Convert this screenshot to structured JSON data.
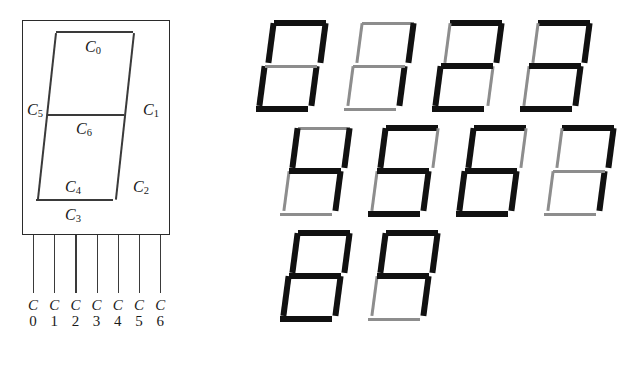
{
  "figure": {
    "segment_order": [
      "C0",
      "C1",
      "C2",
      "C3",
      "C4",
      "C5",
      "C6"
    ]
  },
  "diagram": {
    "name": "seven-segment-display",
    "segment_labels": [
      {
        "id": "C0",
        "letter": "C",
        "index": "0",
        "position": "top"
      },
      {
        "id": "C1",
        "letter": "C",
        "index": "1",
        "position": "top-right"
      },
      {
        "id": "C2",
        "letter": "C",
        "index": "2",
        "position": "bottom-right"
      },
      {
        "id": "C3",
        "letter": "C",
        "index": "3",
        "position": "bottom"
      },
      {
        "id": "C4",
        "letter": "C",
        "index": "4",
        "position": "bottom-left"
      },
      {
        "id": "C5",
        "letter": "C",
        "index": "5",
        "position": "top-left"
      },
      {
        "id": "C6",
        "letter": "C",
        "index": "6",
        "position": "middle"
      }
    ],
    "pins": [
      {
        "letter": "C",
        "index": "0"
      },
      {
        "letter": "C",
        "index": "1"
      },
      {
        "letter": "C",
        "index": "2"
      },
      {
        "letter": "C",
        "index": "3"
      },
      {
        "letter": "C",
        "index": "4"
      },
      {
        "letter": "C",
        "index": "5"
      },
      {
        "letter": "C",
        "index": "6"
      }
    ]
  },
  "colors": {
    "segment_on": "#111111",
    "segment_off": "#8d8d8d",
    "outline": "#2b2b2b",
    "background": "#ffffff"
  },
  "digits": [
    {
      "value": "0",
      "segments": {
        "C0": true,
        "C1": true,
        "C2": true,
        "C3": true,
        "C4": true,
        "C5": true,
        "C6": false
      }
    },
    {
      "value": "1",
      "segments": {
        "C0": false,
        "C1": true,
        "C2": true,
        "C3": false,
        "C4": false,
        "C5": false,
        "C6": false
      }
    },
    {
      "value": "2",
      "segments": {
        "C0": true,
        "C1": true,
        "C2": false,
        "C3": true,
        "C4": true,
        "C5": false,
        "C6": true
      }
    },
    {
      "value": "3",
      "segments": {
        "C0": true,
        "C1": true,
        "C2": true,
        "C3": true,
        "C4": false,
        "C5": false,
        "C6": true
      }
    },
    {
      "value": "4",
      "segments": {
        "C0": false,
        "C1": true,
        "C2": true,
        "C3": false,
        "C4": false,
        "C5": true,
        "C6": true
      }
    },
    {
      "value": "5",
      "segments": {
        "C0": true,
        "C1": false,
        "C2": true,
        "C3": true,
        "C4": false,
        "C5": true,
        "C6": true
      }
    },
    {
      "value": "6",
      "segments": {
        "C0": true,
        "C1": false,
        "C2": true,
        "C3": true,
        "C4": true,
        "C5": true,
        "C6": true
      }
    },
    {
      "value": "7",
      "segments": {
        "C0": true,
        "C1": true,
        "C2": true,
        "C3": false,
        "C4": false,
        "C5": false,
        "C6": false
      }
    },
    {
      "value": "8",
      "segments": {
        "C0": true,
        "C1": true,
        "C2": true,
        "C3": true,
        "C4": true,
        "C5": true,
        "C6": true
      }
    },
    {
      "value": "9",
      "segments": {
        "C0": true,
        "C1": true,
        "C2": true,
        "C3": false,
        "C4": false,
        "C5": true,
        "C6": true
      }
    }
  ],
  "grid": {
    "rows": [
      {
        "digit_indices": [
          0,
          1,
          2,
          3
        ]
      },
      {
        "digit_indices": [
          4,
          5,
          6,
          7
        ]
      },
      {
        "digit_indices": [
          8,
          9
        ]
      }
    ],
    "column_x": [
      0,
      88,
      176,
      264
    ],
    "row_indent": [
      6,
      30,
      30
    ]
  }
}
